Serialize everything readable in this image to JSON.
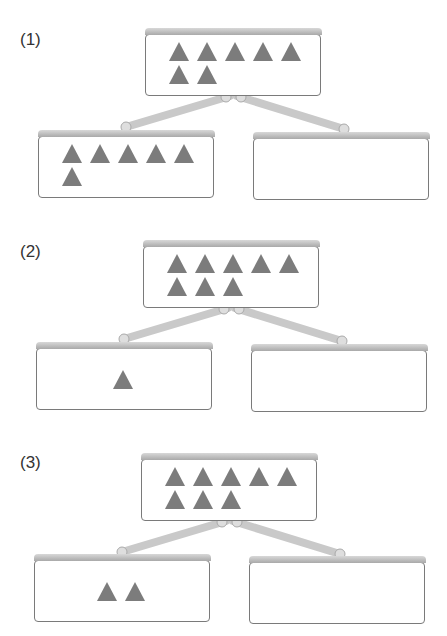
{
  "problems": [
    {
      "label": "(1)",
      "whole": {
        "count": 7,
        "rows": [
          5,
          2
        ]
      },
      "left_part": {
        "count": 6,
        "rows": [
          5,
          1
        ]
      },
      "right_part": {
        "count": null,
        "content": ""
      }
    },
    {
      "label": "(2)",
      "whole": {
        "count": 8,
        "rows": [
          5,
          3
        ]
      },
      "left_part": {
        "count": 1,
        "rows": [
          1
        ]
      },
      "right_part": {
        "count": null,
        "content": ""
      }
    },
    {
      "label": "(3)",
      "whole": {
        "count": 8,
        "rows": [
          5,
          3
        ]
      },
      "left_part": {
        "count": 2,
        "rows": [
          2
        ]
      },
      "right_part": {
        "count": null,
        "content": ""
      }
    }
  ],
  "colors": {
    "triangle": "#7c7c7c",
    "box_border": "#7a7a7a",
    "connector": "#c8c8c8"
  }
}
